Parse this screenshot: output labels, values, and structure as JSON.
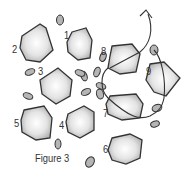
{
  "figure": {
    "caption": "Figure 3",
    "cells": [
      {
        "id": "1",
        "label": "1"
      },
      {
        "id": "2",
        "label": "2"
      },
      {
        "id": "3",
        "label": "3"
      },
      {
        "id": "4",
        "label": "4"
      },
      {
        "id": "5",
        "label": "5"
      },
      {
        "id": "6",
        "label": "6"
      },
      {
        "id": "7",
        "label": "7"
      },
      {
        "id": "8",
        "label": "8"
      },
      {
        "id": "9",
        "label": "9"
      }
    ],
    "colors": {
      "outline": "#333333",
      "cell_fill": "#e6e6e6",
      "cell_shade": "#a8a8a8",
      "particle_fill": "#b5b5b5"
    }
  }
}
